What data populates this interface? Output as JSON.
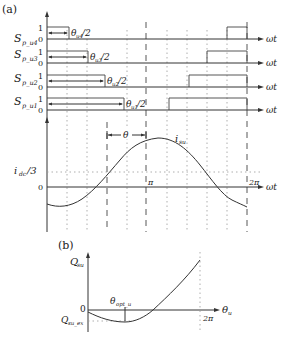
{
  "panel_a": {
    "label": "(a)",
    "x_axis_label": "ωt",
    "signals": [
      {
        "name": "S",
        "sub": "p_u4",
        "high": "1",
        "low": "0",
        "annot_theta": "θ",
        "annot_sub": "u4",
        "annot_tail": "/2"
      },
      {
        "name": "S",
        "sub": "p_u3",
        "high": "1",
        "low": "0",
        "annot_theta": "θ",
        "annot_sub": "u3",
        "annot_tail": "/2"
      },
      {
        "name": "S",
        "sub": "p_u2",
        "high": "1",
        "low": "0",
        "annot_theta": "θ",
        "annot_sub": "u2",
        "annot_tail": "/2"
      },
      {
        "name": "S",
        "sub": "p_u1",
        "high": "1",
        "low": "0",
        "annot_theta": "θ",
        "annot_sub": "u1",
        "annot_tail": "/2"
      }
    ],
    "current_plot": {
      "curve_label": "i",
      "curve_sub": "su",
      "ref_label": "i",
      "ref_sub": "dc",
      "ref_tail": "/3",
      "zero_label": "0",
      "pi_label": "π",
      "two_pi_label": "2π",
      "theta_label": "θ"
    }
  },
  "panel_b": {
    "label": "(b)",
    "y_axis_label": "Q",
    "y_axis_sub": "su",
    "x_axis_label": "θ",
    "x_axis_sub": "u",
    "zero_label": "0",
    "min_label": "Q",
    "min_sub": "su_ex",
    "opt_label": "θ",
    "opt_sub": "opt_u",
    "two_pi_label": "2π"
  },
  "colors": {
    "line": "#333333",
    "grid": "#9a9a9a",
    "background": "#ffffff"
  }
}
